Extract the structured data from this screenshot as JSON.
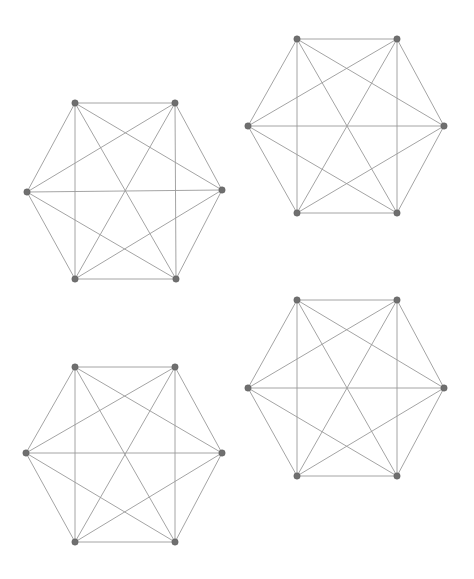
{
  "figure": {
    "title": "",
    "background_color": "#ffffff",
    "width": 474,
    "height": 579,
    "edge_color": "#9a9a9a",
    "vertex_color": "#6f6f6f",
    "vertex_radius": 3.2,
    "edge_width": 0.9,
    "panel_count": 4,
    "layout": "2x2 grid of complete graphs"
  },
  "chart_data": {
    "type": "diagram",
    "title": "",
    "xlabel": "",
    "ylabel": "",
    "graph_type": "complete-graph",
    "vertices_per_graph": 6,
    "edges_per_graph": 15,
    "edge_list": [
      [
        0,
        1
      ],
      [
        0,
        2
      ],
      [
        0,
        3
      ],
      [
        0,
        4
      ],
      [
        0,
        5
      ],
      [
        1,
        2
      ],
      [
        1,
        3
      ],
      [
        1,
        4
      ],
      [
        1,
        5
      ],
      [
        2,
        3
      ],
      [
        2,
        4
      ],
      [
        2,
        5
      ],
      [
        3,
        4
      ],
      [
        3,
        5
      ],
      [
        4,
        5
      ]
    ],
    "vertex_labels": [
      "v0",
      "v1",
      "v2",
      "v3",
      "v4",
      "v5"
    ],
    "panels": [
      {
        "name": "graph-top-left",
        "position": "top-left",
        "vertices": [
          {
            "id": 0,
            "x": 75,
            "y": 103
          },
          {
            "id": 1,
            "x": 175,
            "y": 103
          },
          {
            "id": 2,
            "x": 222,
            "y": 190
          },
          {
            "id": 3,
            "x": 176,
            "y": 279
          },
          {
            "id": 4,
            "x": 75,
            "y": 279
          },
          {
            "id": 5,
            "x": 27,
            "y": 192
          }
        ]
      },
      {
        "name": "graph-top-right",
        "position": "top-right",
        "vertices": [
          {
            "id": 0,
            "x": 297,
            "y": 39
          },
          {
            "id": 1,
            "x": 397,
            "y": 39
          },
          {
            "id": 2,
            "x": 444,
            "y": 126
          },
          {
            "id": 3,
            "x": 397,
            "y": 213
          },
          {
            "id": 4,
            "x": 297,
            "y": 213
          },
          {
            "id": 5,
            "x": 248,
            "y": 126
          }
        ]
      },
      {
        "name": "graph-bottom-left",
        "position": "bottom-left",
        "vertices": [
          {
            "id": 0,
            "x": 75,
            "y": 367
          },
          {
            "id": 1,
            "x": 175,
            "y": 367
          },
          {
            "id": 2,
            "x": 222,
            "y": 453
          },
          {
            "id": 3,
            "x": 175,
            "y": 542
          },
          {
            "id": 4,
            "x": 75,
            "y": 542
          },
          {
            "id": 5,
            "x": 26,
            "y": 453
          }
        ]
      },
      {
        "name": "graph-bottom-right",
        "position": "bottom-right",
        "vertices": [
          {
            "id": 0,
            "x": 297,
            "y": 300
          },
          {
            "id": 1,
            "x": 397,
            "y": 300
          },
          {
            "id": 2,
            "x": 444,
            "y": 388
          },
          {
            "id": 3,
            "x": 397,
            "y": 476
          },
          {
            "id": 4,
            "x": 297,
            "y": 476
          },
          {
            "id": 5,
            "x": 248,
            "y": 388
          }
        ]
      }
    ]
  }
}
